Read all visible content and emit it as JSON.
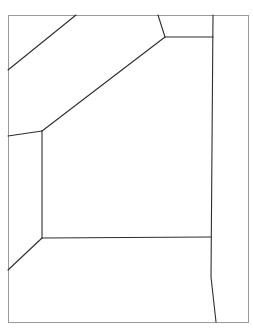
{
  "diagram": {
    "type": "line-drawing",
    "canvas": {
      "width": 253,
      "height": 331
    },
    "colors": {
      "background": "#ffffff",
      "frame": "#9a9a9a",
      "lines": "#2e2e2e"
    },
    "frame": {
      "x": 8,
      "y": 15,
      "width": 240,
      "height": 307
    },
    "segments": [
      {
        "id": "upper-left-diagonal",
        "points": [
          [
            76,
            15
          ],
          [
            8,
            70
          ]
        ]
      },
      {
        "id": "top-short-slant",
        "points": [
          [
            158,
            15
          ],
          [
            165,
            37
          ]
        ]
      },
      {
        "id": "top-right-horizontal",
        "points": [
          [
            165,
            37
          ],
          [
            213,
            37
          ]
        ]
      },
      {
        "id": "ceiling-diagonal",
        "points": [
          [
            165,
            37
          ],
          [
            42,
            131
          ]
        ]
      },
      {
        "id": "left-wall-top",
        "points": [
          [
            8,
            136
          ],
          [
            42,
            131
          ]
        ]
      },
      {
        "id": "back-wall-left",
        "points": [
          [
            42,
            131
          ],
          [
            42,
            238
          ]
        ]
      },
      {
        "id": "floor-back-edge",
        "points": [
          [
            42,
            238
          ],
          [
            211,
            237
          ]
        ]
      },
      {
        "id": "lower-left-diagonal",
        "points": [
          [
            42,
            238
          ],
          [
            8,
            270
          ]
        ]
      },
      {
        "id": "right-vertical",
        "points": [
          [
            213,
            15
          ],
          [
            211,
            277
          ],
          [
            216,
            322
          ]
        ]
      }
    ]
  },
  "caption": {
    "text": "",
    "legible": false
  }
}
